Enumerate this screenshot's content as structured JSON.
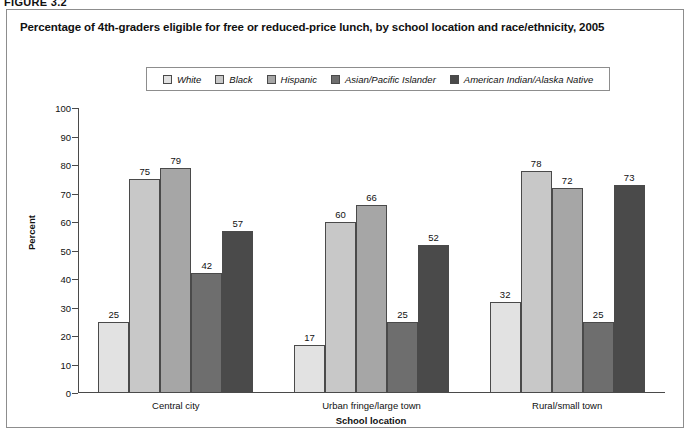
{
  "figure_label": "FIGURE 3.2",
  "chart_title": "Percentage of 4th-graders eligible for free or reduced-price lunch, by school location and race/ethnicity, 2005",
  "chart_data": {
    "type": "bar",
    "title": "Percentage of 4th-graders eligible for free or reduced-price lunch, by school location and race/ethnicity, 2005",
    "xlabel": "School location",
    "ylabel": "Percent",
    "ylim": [
      0,
      100
    ],
    "ytick_step": 10,
    "yticks": [
      "100",
      "90",
      "80",
      "70",
      "60",
      "50",
      "40",
      "30",
      "20",
      "10",
      "0"
    ],
    "grid": false,
    "legend_position": "top-center",
    "categories": [
      "Central city",
      "Urban fringe/large town",
      "Rural/small town"
    ],
    "series": [
      {
        "name": "White",
        "color": "#e2e2e2",
        "values": [
          25,
          17,
          32
        ]
      },
      {
        "name": "Black",
        "color": "#c8c8c8",
        "values": [
          75,
          60,
          78
        ]
      },
      {
        "name": "Hispanic",
        "color": "#a6a6a6",
        "values": [
          79,
          66,
          72
        ]
      },
      {
        "name": "Asian/Pacific Islander",
        "color": "#6e6e6e",
        "values": [
          42,
          25,
          25
        ]
      },
      {
        "name": "American Indian/Alaska Native",
        "color": "#4a4a4a",
        "values": [
          57,
          52,
          73
        ]
      }
    ]
  }
}
